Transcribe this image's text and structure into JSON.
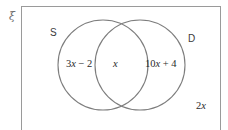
{
  "figure": {
    "type": "venn-diagram",
    "universal_set_symbol": "ξ",
    "sets": [
      {
        "id": "S",
        "label": "S"
      },
      {
        "id": "D",
        "label": "D"
      }
    ],
    "regions": [
      {
        "id": "s-only",
        "prefix": "3",
        "variable": "x",
        "suffix": " − 2"
      },
      {
        "id": "intersection",
        "prefix": "",
        "variable": "x",
        "suffix": ""
      },
      {
        "id": "d-only",
        "prefix": "10",
        "variable": "x",
        "suffix": " + 4"
      },
      {
        "id": "outside",
        "prefix": "2",
        "variable": "x",
        "suffix": ""
      }
    ],
    "region_text": {
      "s_only": "3x − 2",
      "intersection": "x",
      "d_only": "10x + 4",
      "outside": "2x"
    },
    "colors": {
      "rectangle_border": "#9a9a9a",
      "circle_stroke": "#7d7d7d",
      "text": "#2b2b2b",
      "set_label_text": "#3a3a3a",
      "xi_text": "#6e6e6e",
      "background": "#ffffff"
    },
    "geometry": {
      "circle_left": {
        "cx": 103,
        "cy": 65,
        "r": 45
      },
      "circle_right": {
        "cx": 140,
        "cy": 65,
        "r": 45
      }
    }
  }
}
